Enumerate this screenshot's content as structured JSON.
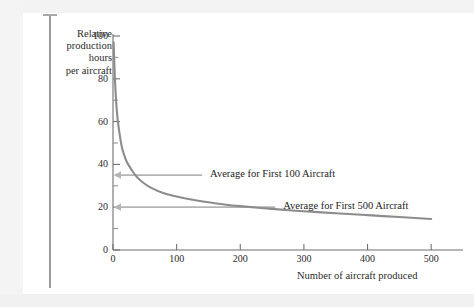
{
  "page": {
    "background_color": "#fdfdfd",
    "margin_rule_color": "#9a9a9a"
  },
  "chart_data": {
    "type": "line",
    "title": "",
    "subtitle": "",
    "xlabel": "Number of aircraft produced",
    "ylabel": "Relative production hours per aircraft",
    "ylabel_lines": [
      "Relative",
      "production",
      "hours",
      "per aircraft"
    ],
    "xlim": [
      0,
      550
    ],
    "ylim": [
      0,
      100
    ],
    "xticks": [
      0,
      100,
      200,
      300,
      400,
      500
    ],
    "xtick_labels": [
      "0",
      "100",
      "200",
      "300",
      "400",
      "500"
    ],
    "yticks": [
      0,
      20,
      40,
      60,
      80,
      100
    ],
    "ytick_labels": [
      "0",
      "20",
      "40",
      "60",
      "80",
      "100"
    ],
    "y_minor_ticks": [
      10,
      30,
      50,
      70,
      90
    ],
    "grid": false,
    "legend": "none",
    "series": [
      {
        "name": "Learning curve",
        "color": "#8c8c8c",
        "x": [
          1,
          2,
          3,
          5,
          7,
          10,
          14,
          18,
          22,
          28,
          35,
          45,
          60,
          80,
          100,
          125,
          150,
          175,
          200,
          250,
          300,
          350,
          400,
          450,
          500
        ],
        "values": [
          97,
          88,
          80,
          69,
          62,
          55,
          48,
          44,
          41,
          38,
          35,
          32,
          29,
          26.5,
          25,
          23.5,
          22.3,
          21.3,
          20.5,
          19.2,
          18.1,
          17.2,
          16.3,
          15.4,
          14.5
        ]
      }
    ],
    "annotations": [
      {
        "label": "Average for First 100 Aircraft",
        "value": 35,
        "arrow_color": "#b4b4b4",
        "arrow_from_x": 140,
        "arrow_to_x": 0
      },
      {
        "label": "Average for First 500 Aircraft",
        "value": 20,
        "arrow_color": "#b4b4b4",
        "arrow_from_x": 255,
        "arrow_to_x": 0
      }
    ]
  }
}
